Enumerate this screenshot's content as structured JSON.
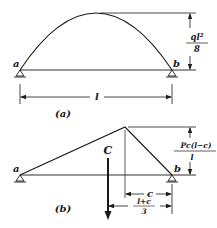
{
  "diagram_a": {
    "caption": "(a)",
    "support_left": "a",
    "support_right": "b",
    "span_label": "l",
    "max_moment_num": "ql²",
    "max_moment_den": "8",
    "shape": "parabola"
  },
  "diagram_b": {
    "caption": "(b)",
    "support_left": "a",
    "support_right": "b",
    "load_label": "C",
    "max_moment_num": "Pc(l−c)",
    "max_moment_den": "l",
    "dim_c_label": "c",
    "dim_resultant_num": "l+c",
    "dim_resultant_den": "3",
    "shape": "triangle"
  },
  "colors": {
    "line": "#1a1a1a",
    "background": "#ffffff"
  }
}
